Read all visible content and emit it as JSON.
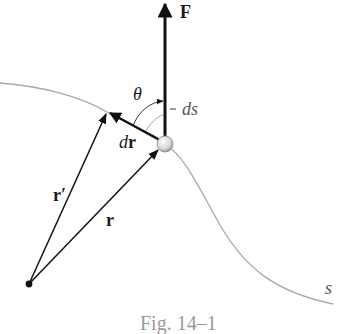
{
  "figure": {
    "caption": "Fig. 14–1",
    "labels": {
      "force": "F",
      "angle": "θ",
      "arc_length": "ds",
      "displacement_d": "d",
      "displacement_r": "r",
      "position_prime": "r′",
      "position": "r",
      "path": "s"
    },
    "colors": {
      "vector": "#111111",
      "path_curve": "#a8a8a8",
      "particle_fill": "#e4e4e4",
      "particle_stroke": "#8c8c8c",
      "caption": "#9a9a9a"
    },
    "points": {
      "origin": [
        29,
        284
      ],
      "particle": [
        165,
        144
      ],
      "displaced_particle": [
        107,
        112
      ],
      "force_tip": [
        165,
        2
      ]
    }
  }
}
